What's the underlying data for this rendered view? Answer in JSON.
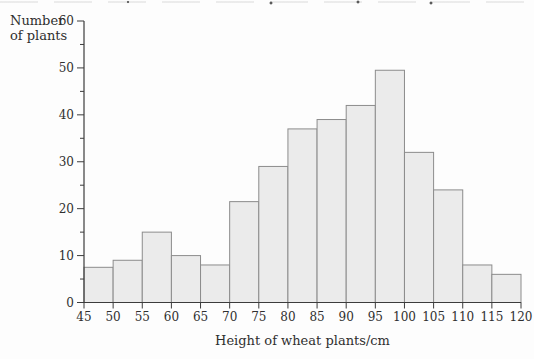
{
  "figure": {
    "background": "#fdfdfd",
    "top_edge_note": "cropped descenders of a previous text line"
  },
  "chart_data": {
    "type": "bar",
    "chart_kind": "histogram",
    "title": "",
    "xlabel": "Height of wheat plants/cm",
    "ylabel": "Number of plants",
    "xlim": [
      45,
      120
    ],
    "ylim": [
      0,
      60
    ],
    "bin_width": 5,
    "categories": [
      "45-50",
      "50-55",
      "55-60",
      "60-65",
      "65-70",
      "70-75",
      "75-80",
      "80-85",
      "85-90",
      "90-95",
      "95-100",
      "100-105",
      "105-110",
      "110-115",
      "115-120"
    ],
    "values": [
      7.5,
      9,
      15,
      10,
      8,
      21.5,
      29,
      37,
      39,
      42,
      49.5,
      32,
      24,
      8,
      6
    ],
    "x_tick_labels": [
      45,
      50,
      55,
      60,
      65,
      70,
      75,
      80,
      85,
      90,
      95,
      100,
      105,
      110,
      115,
      120
    ],
    "y_tick_labels": [
      0,
      10,
      20,
      30,
      40,
      50,
      60
    ],
    "y_minor_ticks": [
      5,
      15,
      25,
      35,
      45,
      55
    ],
    "grid": false,
    "legend_position": "none",
    "colors": {
      "bar_fill": "#ebebeb",
      "bar_stroke": "#8c8c8c",
      "axis": "#3c3c3c",
      "text": "#2f2f2f"
    }
  }
}
